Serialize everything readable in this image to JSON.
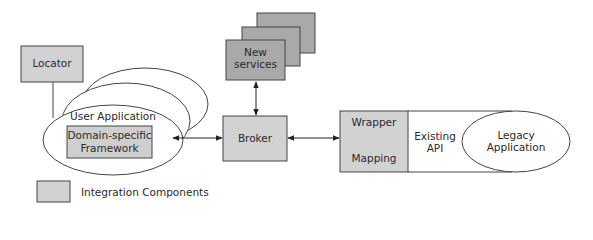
{
  "diagram": {
    "nodes": {
      "locator": {
        "label": "Locator",
        "fill": "#d2d2d2"
      },
      "user_application": {
        "label": "User Application"
      },
      "domain_framework": {
        "line1": "Domain-specific",
        "line2": "Framework",
        "fill": "#cfcfcf"
      },
      "new_services": {
        "line1": "New",
        "line2": "services",
        "fill": "#a9a9a9"
      },
      "broker": {
        "label": "Broker",
        "fill": "#d2d2d2"
      },
      "wrapper": {
        "top": "Wrapper",
        "bottom": "Mapping",
        "fill": "#d2d2d2"
      },
      "existing_api": {
        "line1": "Existing",
        "line2": "API"
      },
      "legacy_application": {
        "line1": "Legacy",
        "line2": "Application"
      }
    },
    "edges": [
      {
        "from": "locator",
        "to": "user_application",
        "type": "line"
      },
      {
        "from": "user_application",
        "to": "broker",
        "type": "bidirectional-arrow"
      },
      {
        "from": "new_services",
        "to": "broker",
        "type": "bidirectional-arrow"
      },
      {
        "from": "broker",
        "to": "wrapper",
        "type": "bidirectional-arrow"
      }
    ],
    "legend": {
      "label": "Integration Components",
      "swatch_color": "#d2d2d2"
    }
  }
}
